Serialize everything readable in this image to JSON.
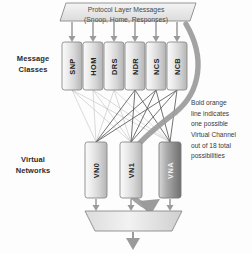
{
  "diagram": {
    "title_banner": {
      "line1": "Protocol Layer Messages",
      "line2": "(Snoop, Home, Responses)"
    },
    "sections": {
      "message_classes_label_line1": "Message",
      "message_classes_label_line2": "Classes",
      "virtual_networks_label_line1": "Virtual",
      "virtual_networks_label_line2": "Networks"
    },
    "message_classes": [
      {
        "label": "SNP"
      },
      {
        "label": "HOM"
      },
      {
        "label": "DRS"
      },
      {
        "label": "NDR"
      },
      {
        "label": "NCS"
      },
      {
        "label": "NCB"
      }
    ],
    "virtual_networks": [
      {
        "label": "VN0"
      },
      {
        "label": "VN1"
      },
      {
        "label": "VNA"
      }
    ],
    "annotation": {
      "line1": "Bold orange",
      "line2": "line indicates",
      "line3": "one possible",
      "line4": "Virtual Channel",
      "line5": "out of 18 total",
      "line6": "possibilities"
    },
    "colors": {
      "box_fill_light": "#e9e9e9",
      "box_fill_dark": "#8f8f8f",
      "outline": "#8a8a8a",
      "arrow": "#9a9a9a",
      "highlight_line": "#9b9b9b",
      "thin_line_dark": "#555555",
      "thin_line_light": "#c2c2c2",
      "text": "#2b2b2b"
    }
  }
}
